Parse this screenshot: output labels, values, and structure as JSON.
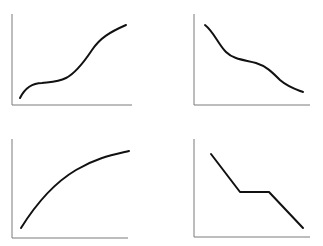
{
  "figure": {
    "panels": [
      {
        "id": "top-left",
        "shape": "S-shaped increasing curve with plateau"
      },
      {
        "id": "top-right",
        "shape": "decreasing curve with inflection plateau"
      },
      {
        "id": "bottom-left",
        "shape": "concave increasing curve (diminishing growth)"
      },
      {
        "id": "bottom-right",
        "shape": "piecewise linear decreasing with flat middle segment"
      }
    ],
    "colors": {
      "axis": "#7a7a7a",
      "curve": "#111111",
      "background": "#ffffff"
    }
  }
}
